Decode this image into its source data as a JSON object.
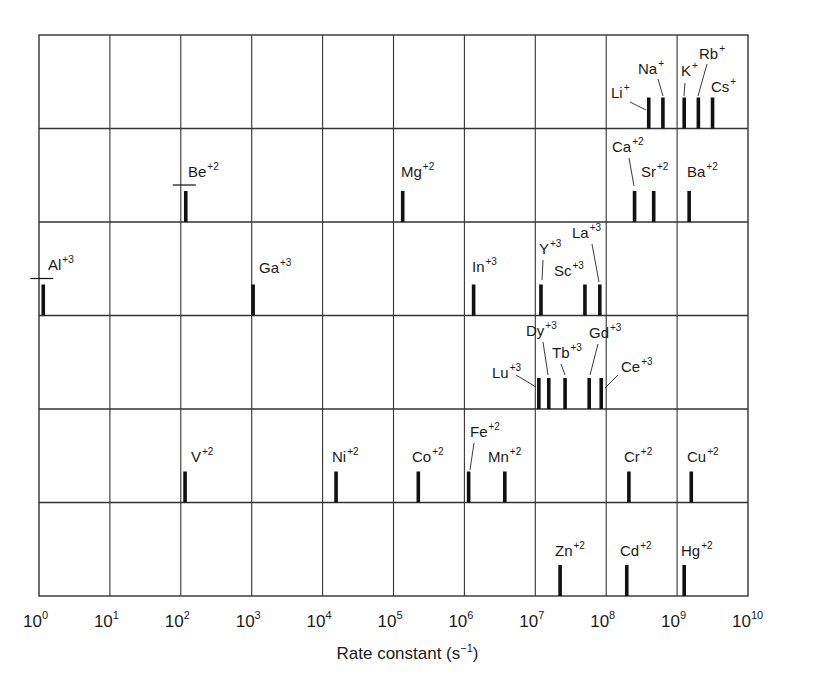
{
  "chart_data": {
    "type": "bar",
    "title": "",
    "xlabel": "Rate constant (s⁻¹)",
    "xlabel_base": "Rate constant (s",
    "xlabel_exp": "−1",
    "xlabel_end": ")",
    "ylabel": "",
    "xscale": "log10",
    "xlim": [
      0,
      10
    ],
    "x_ticks": [
      "10^0",
      "10^1",
      "10^2",
      "10^3",
      "10^4",
      "10^5",
      "10^6",
      "10^7",
      "10^8",
      "10^9",
      "10^10"
    ],
    "grid": true,
    "legend": null,
    "rows": [
      {
        "name": "alkali metals (+1)",
        "ions": [
          {
            "symbol": "Li",
            "charge": "+",
            "log_k": 8.6
          },
          {
            "symbol": "Na",
            "charge": "+",
            "log_k": 8.8
          },
          {
            "symbol": "K",
            "charge": "+",
            "log_k": 9.1
          },
          {
            "symbol": "Rb",
            "charge": "+",
            "log_k": 9.3
          },
          {
            "symbol": "Cs",
            "charge": "+",
            "log_k": 9.5
          }
        ]
      },
      {
        "name": "alkaline earth (+2)",
        "ions": [
          {
            "symbol": "Be",
            "charge": "+2",
            "log_k": 2.07,
            "range_bar": true
          },
          {
            "symbol": "Mg",
            "charge": "+2",
            "log_k": 5.13
          },
          {
            "symbol": "Ca",
            "charge": "+2",
            "log_k": 8.4
          },
          {
            "symbol": "Sr",
            "charge": "+2",
            "log_k": 8.67
          },
          {
            "symbol": "Ba",
            "charge": "+2",
            "log_k": 9.17
          }
        ]
      },
      {
        "name": "trivalent group 3/13 (+3)",
        "ions": [
          {
            "symbol": "Al",
            "charge": "+3",
            "log_k": 0.06,
            "range_bar": true
          },
          {
            "symbol": "Ga",
            "charge": "+3",
            "log_k": 3.02
          },
          {
            "symbol": "In",
            "charge": "+3",
            "log_k": 6.13
          },
          {
            "symbol": "Y",
            "charge": "+3",
            "log_k": 7.08
          },
          {
            "symbol": "Sc",
            "charge": "+3",
            "log_k": 7.7
          },
          {
            "symbol": "La",
            "charge": "+3",
            "log_k": 7.91
          }
        ]
      },
      {
        "name": "lanthanides (+3)",
        "ions": [
          {
            "symbol": "Lu",
            "charge": "+3",
            "log_k": 7.05
          },
          {
            "symbol": "Dy",
            "charge": "+3",
            "log_k": 7.19
          },
          {
            "symbol": "Tb",
            "charge": "+3",
            "log_k": 7.42
          },
          {
            "symbol": "Gd",
            "charge": "+3",
            "log_k": 7.76
          },
          {
            "symbol": "Ce",
            "charge": "+3",
            "log_k": 7.93
          }
        ]
      },
      {
        "name": "first-row transition metals (+2)",
        "ions": [
          {
            "symbol": "V",
            "charge": "+2",
            "log_k": 2.06
          },
          {
            "symbol": "Ni",
            "charge": "+2",
            "log_k": 4.19
          },
          {
            "symbol": "Co",
            "charge": "+2",
            "log_k": 5.35
          },
          {
            "symbol": "Fe",
            "charge": "+2",
            "log_k": 6.06
          },
          {
            "symbol": "Mn",
            "charge": "+2",
            "log_k": 6.57
          },
          {
            "symbol": "Cr",
            "charge": "+2",
            "log_k": 8.32
          },
          {
            "symbol": "Cu",
            "charge": "+2",
            "log_k": 9.2
          }
        ]
      },
      {
        "name": "group 12 (+2)",
        "ions": [
          {
            "symbol": "Zn",
            "charge": "+2",
            "log_k": 7.35
          },
          {
            "symbol": "Cd",
            "charge": "+2",
            "log_k": 8.29
          },
          {
            "symbol": "Hg",
            "charge": "+2",
            "log_k": 9.1
          }
        ]
      }
    ]
  },
  "layout": {
    "plot_left": 39,
    "plot_right": 748,
    "plot_top": 35,
    "plot_bottom": 596,
    "row_count": 6,
    "bar_color": "#111111",
    "grid_color": "#333333"
  },
  "labels": [
    {
      "row": 0,
      "symbol": "Li",
      "charge": "+",
      "x": 611,
      "y": 98,
      "lx1": 630,
      "ly1": 102,
      "lx2": 646,
      "ly2": 110
    },
    {
      "row": 0,
      "symbol": "Na",
      "charge": "+",
      "x": 638,
      "y": 74,
      "lx1": 658,
      "ly1": 79,
      "lx2": 663,
      "ly2": 96
    },
    {
      "row": 0,
      "symbol": "K",
      "charge": "+",
      "x": 681,
      "y": 76,
      "lx1": 685,
      "ly1": 83,
      "lx2": 684,
      "ly2": 96
    },
    {
      "row": 0,
      "symbol": "Rb",
      "charge": "+",
      "x": 699,
      "y": 59,
      "lx1": 707,
      "ly1": 64,
      "lx2": 698,
      "ly2": 96
    },
    {
      "row": 0,
      "symbol": "Cs",
      "charge": "+",
      "x": 711,
      "y": 92
    },
    {
      "row": 1,
      "symbol": "Be",
      "charge": "+2",
      "x": 188,
      "y": 177
    },
    {
      "row": 1,
      "symbol": "Mg",
      "charge": "+2",
      "x": 401,
      "y": 177
    },
    {
      "row": 1,
      "symbol": "Ca",
      "charge": "+2",
      "x": 612,
      "y": 152,
      "lx1": 629,
      "ly1": 158,
      "lx2": 634,
      "ly2": 186
    },
    {
      "row": 1,
      "symbol": "Sr",
      "charge": "+2",
      "x": 641,
      "y": 177
    },
    {
      "row": 1,
      "symbol": "Ba",
      "charge": "+2",
      "x": 687,
      "y": 177
    },
    {
      "row": 2,
      "symbol": "Al",
      "charge": "+3",
      "x": 48,
      "y": 270
    },
    {
      "row": 2,
      "symbol": "Ga",
      "charge": "+3",
      "x": 259,
      "y": 273
    },
    {
      "row": 2,
      "symbol": "In",
      "charge": "+3",
      "x": 472,
      "y": 272
    },
    {
      "row": 2,
      "symbol": "Y",
      "charge": "+3",
      "x": 539,
      "y": 254,
      "lx1": 543,
      "ly1": 260,
      "lx2": 542,
      "ly2": 280
    },
    {
      "row": 2,
      "symbol": "Sc",
      "charge": "+3",
      "x": 554,
      "y": 276
    },
    {
      "row": 2,
      "symbol": "La",
      "charge": "+3",
      "x": 572,
      "y": 238,
      "lx1": 592,
      "ly1": 244,
      "lx2": 599,
      "ly2": 282
    },
    {
      "row": 3,
      "symbol": "Lu",
      "charge": "+3",
      "x": 492,
      "y": 378,
      "lx1": 516,
      "ly1": 375,
      "lx2": 536,
      "ly2": 387
    },
    {
      "row": 3,
      "symbol": "Dy",
      "charge": "+3",
      "x": 526,
      "y": 336,
      "lx1": 543,
      "ly1": 342,
      "lx2": 548,
      "ly2": 375
    },
    {
      "row": 3,
      "symbol": "Tb",
      "charge": "+3",
      "x": 552,
      "y": 358,
      "lx1": 561,
      "ly1": 364,
      "lx2": 565,
      "ly2": 375
    },
    {
      "row": 3,
      "symbol": "Gd",
      "charge": "+3",
      "x": 589,
      "y": 338,
      "lx1": 598,
      "ly1": 344,
      "lx2": 590,
      "ly2": 375
    },
    {
      "row": 3,
      "symbol": "Ce",
      "charge": "+3",
      "x": 621,
      "y": 372,
      "lx1": 618,
      "ly1": 375,
      "lx2": 605,
      "ly2": 388
    },
    {
      "row": 4,
      "symbol": "V",
      "charge": "+2",
      "x": 191,
      "y": 462
    },
    {
      "row": 4,
      "symbol": "Ni",
      "charge": "+2",
      "x": 332,
      "y": 462
    },
    {
      "row": 4,
      "symbol": "Co",
      "charge": "+2",
      "x": 412,
      "y": 462
    },
    {
      "row": 4,
      "symbol": "Fe",
      "charge": "+2",
      "x": 470,
      "y": 437,
      "lx1": 474,
      "ly1": 443,
      "lx2": 470,
      "ly2": 470
    },
    {
      "row": 4,
      "symbol": "Mn",
      "charge": "+2",
      "x": 488,
      "y": 462
    },
    {
      "row": 4,
      "symbol": "Cr",
      "charge": "+2",
      "x": 624,
      "y": 462
    },
    {
      "row": 4,
      "symbol": "Cu",
      "charge": "+2",
      "x": 687,
      "y": 462
    },
    {
      "row": 5,
      "symbol": "Zn",
      "charge": "+2",
      "x": 555,
      "y": 556
    },
    {
      "row": 5,
      "symbol": "Cd",
      "charge": "+2",
      "x": 620,
      "y": 556
    },
    {
      "row": 5,
      "symbol": "Hg",
      "charge": "+2",
      "x": 681,
      "y": 556
    }
  ]
}
